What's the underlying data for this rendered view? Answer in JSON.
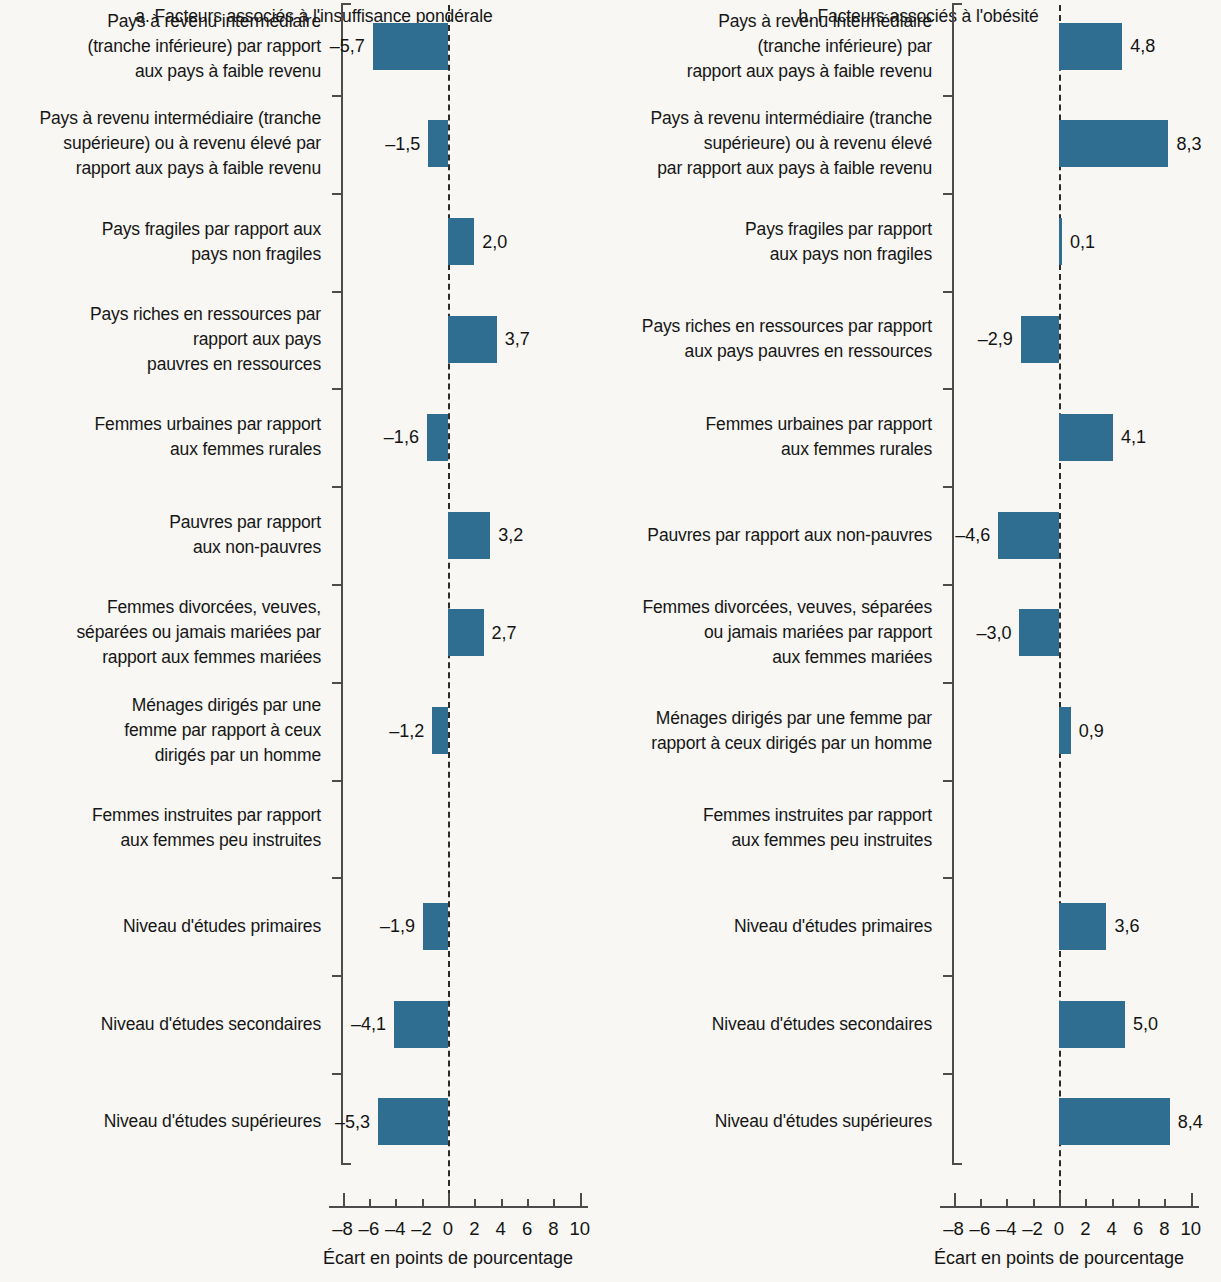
{
  "chart_data": {
    "type": "bar",
    "orientation": "horizontal",
    "title": "",
    "xlabel": "Écart en points de pourcentage",
    "ylabel": "",
    "xlim": [
      -9,
      10.6
    ],
    "xticks": [
      -8,
      -6,
      -4,
      -2,
      0,
      2,
      4,
      6,
      8,
      10
    ],
    "xticklabels": [
      "–8",
      "–6",
      "–4",
      "–2",
      "0",
      "2",
      "4",
      "6",
      "8",
      "10"
    ],
    "grid": false,
    "legend": null,
    "zero_reference_line": 0,
    "bar_color": "#2f6e91",
    "background_color": "#f8f7f3",
    "categories": [
      "Pays à revenu intermédiaire (tranche inférieure) par rapport aux pays à faible revenu",
      "Pays à revenu intermédiaire (tranche supérieure) ou à revenu élevé par rapport aux pays à faible revenu",
      "Pays fragiles par rapport aux pays non fragiles",
      "Pays riches en ressources par rapport aux pays pauvres en ressources",
      "Femmes urbaines par rapport aux femmes rurales",
      "Pauvres par rapport aux non-pauvres",
      "Femmes divorcées, veuves, séparées ou jamais mariées par rapport aux femmes mariées",
      "Ménages dirigés par une femme par rapport à ceux dirigés par un homme",
      "Femmes instruites par rapport aux femmes peu instruites",
      "Niveau d'études primaires",
      "Niveau d'études secondaires",
      "Niveau d'études supérieures"
    ],
    "panels": [
      {
        "key": "a",
        "title": "a. Facteurs associés à l'insuffisance pondérale",
        "values": [
          -5.7,
          -1.5,
          2.0,
          3.7,
          -1.6,
          3.2,
          2.7,
          -1.2,
          null,
          -1.9,
          -4.1,
          -5.3
        ],
        "value_labels": [
          "–5,7",
          "–1,5",
          "2,0",
          "3,7",
          "–1,6",
          "3,2",
          "2,7",
          "–1,2",
          "",
          "–1,9",
          "–4,1",
          "–5,3"
        ]
      },
      {
        "key": "b",
        "title": "b. Facteurs associés à l'obésité",
        "values": [
          4.8,
          8.3,
          0.1,
          -2.9,
          4.1,
          -4.6,
          -3.0,
          0.9,
          null,
          3.6,
          5.0,
          8.4
        ],
        "value_labels": [
          "4,8",
          "8,3",
          "0,1",
          "–2,9",
          "4,1",
          "–4,6",
          "–3,0",
          "0,9",
          "",
          "3,6",
          "5,0",
          "8,4"
        ]
      }
    ]
  },
  "panel_a": {
    "title": "a. Facteurs associés à l'insuffisance pondérale",
    "axis_title": "Écart en points de pourcentage",
    "xticklabels": [
      "–8",
      "–6",
      "–4",
      "–2",
      "0",
      "2",
      "4",
      "6",
      "8",
      "10"
    ],
    "rows": [
      {
        "label_lines": [
          "Pays à revenu intermédiaire",
          "(tranche inférieure) par rapport",
          "aux pays à faible revenu"
        ],
        "value_label": "–5,7"
      },
      {
        "label_lines": [
          "Pays à revenu intermédiaire (tranche",
          "supérieure) ou à revenu élevé par",
          "rapport aux pays à faible revenu"
        ],
        "value_label": "–1,5"
      },
      {
        "label_lines": [
          "Pays fragiles par rapport aux",
          "pays non fragiles"
        ],
        "value_label": "2,0"
      },
      {
        "label_lines": [
          "Pays riches en ressources par",
          "rapport aux pays",
          "pauvres en ressources"
        ],
        "value_label": "3,7"
      },
      {
        "label_lines": [
          "Femmes urbaines par rapport",
          "aux femmes rurales"
        ],
        "value_label": "–1,6"
      },
      {
        "label_lines": [
          "Pauvres par rapport",
          "aux non-pauvres"
        ],
        "value_label": "3,2"
      },
      {
        "label_lines": [
          "Femmes divorcées, veuves,",
          "séparées ou jamais mariées par",
          "rapport aux femmes mariées"
        ],
        "value_label": "2,7"
      },
      {
        "label_lines": [
          "Ménages dirigés par une",
          "femme par rapport à ceux",
          "dirigés par un homme"
        ],
        "value_label": "–1,2"
      },
      {
        "label_lines": [
          "Femmes instruites par rapport",
          "aux femmes peu instruites"
        ],
        "value_label": ""
      },
      {
        "label_lines": [
          "Niveau d'études primaires"
        ],
        "value_label": "–1,9"
      },
      {
        "label_lines": [
          "Niveau d'études secondaires"
        ],
        "value_label": "–4,1"
      },
      {
        "label_lines": [
          "Niveau d'études supérieures"
        ],
        "value_label": "–5,3"
      }
    ]
  },
  "panel_b": {
    "title": "b. Facteurs associés à l'obésité",
    "axis_title": "Écart en points de pourcentage",
    "xticklabels": [
      "–8",
      "–6",
      "–4",
      "–2",
      "0",
      "2",
      "4",
      "6",
      "8",
      "10"
    ],
    "rows": [
      {
        "label_lines": [
          "Pays à revenu intermédiaire",
          "(tranche inférieure) par",
          "rapport aux pays à faible revenu"
        ],
        "value_label": "4,8"
      },
      {
        "label_lines": [
          "Pays à revenu intermédiaire (tranche",
          "supérieure) ou à revenu élevé",
          "par rapport aux pays à faible revenu"
        ],
        "value_label": "8,3"
      },
      {
        "label_lines": [
          "Pays fragiles par rapport",
          "aux pays non fragiles"
        ],
        "value_label": "0,1"
      },
      {
        "label_lines": [
          "Pays riches en ressources par rapport",
          "aux pays pauvres en ressources"
        ],
        "value_label": "–2,9"
      },
      {
        "label_lines": [
          "Femmes urbaines par rapport",
          "aux femmes rurales"
        ],
        "value_label": "4,1"
      },
      {
        "label_lines": [
          "Pauvres par rapport aux non-pauvres"
        ],
        "value_label": "–4,6"
      },
      {
        "label_lines": [
          "Femmes divorcées, veuves, séparées",
          "ou jamais mariées par rapport",
          "aux femmes mariées"
        ],
        "value_label": "–3,0"
      },
      {
        "label_lines": [
          "Ménages dirigés par une femme par",
          "rapport à ceux dirigés par un homme"
        ],
        "value_label": "0,9"
      },
      {
        "label_lines": [
          "Femmes instruites par rapport",
          "aux femmes peu instruites"
        ],
        "value_label": ""
      },
      {
        "label_lines": [
          "Niveau d'études primaires"
        ],
        "value_label": "3,6"
      },
      {
        "label_lines": [
          "Niveau d'études secondaires"
        ],
        "value_label": "5,0"
      },
      {
        "label_lines": [
          "Niveau d'études supérieures"
        ],
        "value_label": "8,4"
      }
    ]
  }
}
